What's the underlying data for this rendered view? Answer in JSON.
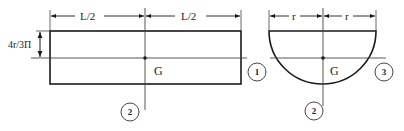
{
  "figures": {
    "rectangle": {
      "dimension_left_half": "L/2",
      "dimension_right_half": "L/2",
      "dimension_offset": "4r/3Π",
      "centroid_label": "G",
      "axis_horizontal_label": "1",
      "axis_vertical_label": "2"
    },
    "semicircle": {
      "dimension_left_radius": "r",
      "dimension_right_radius": "r",
      "centroid_label": "G",
      "axis_horizontal_label": "3",
      "axis_vertical_label": "2"
    }
  },
  "colors": {
    "line": "#1a1a1a",
    "thin_line": "#444444",
    "background": "#ffffff"
  }
}
